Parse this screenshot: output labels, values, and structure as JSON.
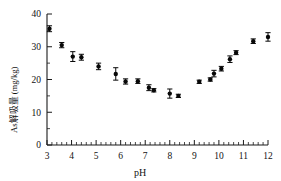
{
  "chart_data": {
    "type": "scatter",
    "title": "",
    "subtitle": "",
    "xlabel": "pH",
    "ylabel": "As解吸量 (mg/kg)",
    "xlim": [
      3,
      12
    ],
    "ylim": [
      0,
      40
    ],
    "xticks": [
      3,
      4,
      5,
      6,
      7,
      8,
      9,
      10,
      11,
      12
    ],
    "xticklabels": [
      "3",
      "4",
      "5",
      "6",
      "7",
      "8",
      "9",
      "10",
      "11",
      "12"
    ],
    "yticks": [
      0,
      10,
      20,
      30,
      40
    ],
    "yticklabels": [
      "0",
      "10",
      "20",
      "30",
      "40"
    ],
    "x_minor_ticks_per_interval": 5,
    "y_minor_ticks_per_interval": 2,
    "grid": false,
    "legend": null,
    "legend_position": "none",
    "marker": "filled-circle",
    "marker_color": "#080808",
    "errorbar_color": "#080808",
    "annotations": [],
    "series": [
      {
        "name": "As desorption",
        "x": [
          3.1,
          3.6,
          4.05,
          4.4,
          5.1,
          5.8,
          6.2,
          6.7,
          7.15,
          7.35,
          8.0,
          8.35,
          9.2,
          9.65,
          9.8,
          10.1,
          10.45,
          10.7,
          11.4,
          12.0
        ],
        "y": [
          35.5,
          30.5,
          27.0,
          26.8,
          24.0,
          21.7,
          19.4,
          19.5,
          17.5,
          16.7,
          15.7,
          15.0,
          19.3,
          20.0,
          21.8,
          23.3,
          26.2,
          28.2,
          31.7,
          33.0
        ],
        "yerr": [
          0.9,
          0.8,
          1.5,
          0.9,
          1.0,
          1.9,
          0.8,
          0.7,
          0.9,
          0.5,
          1.4,
          0.5,
          0.5,
          0.5,
          1.0,
          0.7,
          1.0,
          0.6,
          0.7,
          1.3
        ]
      }
    ]
  },
  "axes": {
    "x_axis_label": "pH",
    "y_axis_label": "As解吸量 (mg/kg)"
  }
}
